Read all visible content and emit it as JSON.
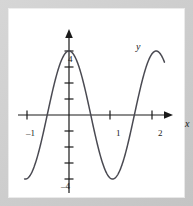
{
  "figure": {
    "background_color": "#c9c9c9",
    "plot_background_color": "#ffffff",
    "curve_color": "#4a4a52",
    "axis_color": "#1a1a1a"
  },
  "axes": {
    "x_axis_label": "x",
    "y_axis_label": "y",
    "x_tick_labels": [
      "–1",
      "1",
      "2"
    ],
    "y_tick_labels": [
      "4",
      "–4"
    ]
  },
  "chart_data": {
    "type": "line",
    "title": "",
    "subtitle": "",
    "xlabel": "x",
    "ylabel": "y",
    "xlim": [
      -1.35,
      2.45
    ],
    "ylim": [
      -4.9,
      4.9
    ],
    "grid": false,
    "legend": null,
    "x_ticks": [
      -1,
      1,
      2
    ],
    "x_tick_labels": [
      "–1",
      "1",
      "2"
    ],
    "y_ticks": [
      -4,
      -3,
      -2,
      -1,
      1,
      2,
      3,
      4
    ],
    "y_tick_labels_shown": {
      "4": "4",
      "-4": "–4"
    },
    "series": [
      {
        "name": "y = 4 cos(3x)",
        "amplitude": 4,
        "period": 2.1,
        "phase": 0,
        "midline": 0,
        "x": [
          -1.07,
          -1.0,
          -0.9,
          -0.8,
          -0.7,
          -0.6,
          -0.5,
          -0.4,
          -0.3,
          -0.2,
          -0.1,
          0.0,
          0.1,
          0.2,
          0.3,
          0.4,
          0.5,
          0.6,
          0.7,
          0.8,
          0.9,
          1.0,
          1.05,
          1.1,
          1.2,
          1.3,
          1.4,
          1.5,
          1.6,
          1.7,
          1.8,
          1.9,
          2.0,
          2.1,
          2.2,
          2.3
        ],
        "y": [
          -4.0,
          -3.76,
          -2.94,
          -1.79,
          -0.47,
          0.88,
          2.09,
          3.03,
          3.64,
          3.95,
          4.0,
          4.0,
          3.95,
          3.64,
          3.03,
          2.09,
          0.88,
          -0.47,
          -1.79,
          -2.94,
          -3.76,
          -4.0,
          -4.0,
          -3.95,
          -3.5,
          -2.6,
          -1.4,
          -0.1,
          1.25,
          2.4,
          3.3,
          3.85,
          4.0,
          4.0,
          4.0,
          4.0
        ]
      }
    ],
    "annotations": [
      {
        "text": "curve peaks at y = 4 on the y-axis",
        "kind": "description"
      },
      {
        "text": "curve minimum y = –4 near x = 1",
        "kind": "description"
      }
    ]
  }
}
